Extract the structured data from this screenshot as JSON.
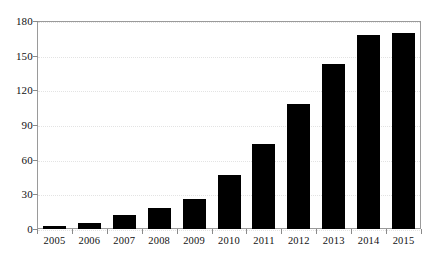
{
  "chart_data": {
    "type": "bar",
    "title": "",
    "xlabel": "",
    "ylabel": "",
    "categories": [
      "2005",
      "2006",
      "2007",
      "2008",
      "2009",
      "2010",
      "2011",
      "2012",
      "2013",
      "2014",
      "2015"
    ],
    "values": [
      3,
      5,
      12,
      18,
      26,
      47,
      74,
      108,
      143,
      168,
      170
    ],
    "series": [
      {
        "name": "",
        "values": [
          3,
          5,
          12,
          18,
          26,
          47,
          74,
          108,
          143,
          168,
          170
        ]
      }
    ],
    "ylim": [
      0,
      180
    ],
    "yticks": [
      0,
      30,
      60,
      90,
      120,
      150,
      180
    ],
    "ytick_labels": [
      "0",
      "30",
      "60",
      "90",
      "120",
      "150",
      "180"
    ],
    "grid": true,
    "grid_axis": "y",
    "legend": false,
    "legend_position": "none",
    "bar_color": "#000000",
    "grid_color": "#e3e3e3",
    "frame_color": "#9a9a9a",
    "background_color": "#ffffff",
    "annotations": []
  }
}
